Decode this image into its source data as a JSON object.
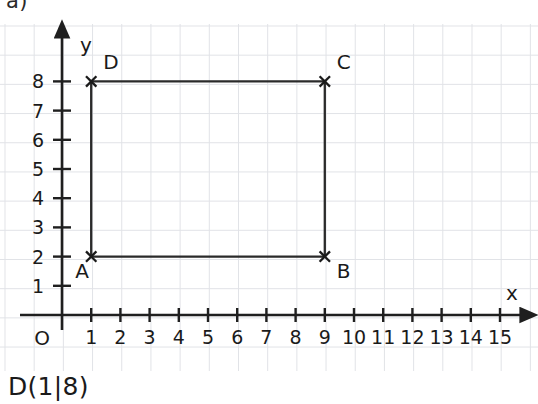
{
  "exercise": {
    "label": "a)"
  },
  "answer": {
    "text": "D(1|8)"
  },
  "chart_data": {
    "type": "scatter",
    "title": "",
    "xlabel": "x",
    "ylabel": "y",
    "origin_label": "O",
    "xlim": [
      0,
      15.8
    ],
    "ylim": [
      0,
      9.2
    ],
    "grid": true,
    "legend": "none",
    "x_ticks": [
      1,
      2,
      3,
      4,
      5,
      6,
      7,
      8,
      9,
      10,
      11,
      12,
      13,
      14,
      15
    ],
    "y_ticks": [
      1,
      2,
      3,
      4,
      5,
      6,
      7,
      8
    ],
    "x_tick_labels": [
      "1",
      "2",
      "3",
      "4",
      "5",
      "6",
      "7",
      "8",
      "9",
      "10",
      "11",
      "12",
      "13",
      "14",
      "15"
    ],
    "y_tick_labels": [
      "1",
      "2",
      "3",
      "4",
      "5",
      "6",
      "7",
      "8"
    ],
    "points": [
      {
        "name": "A",
        "x": 1,
        "y": 2,
        "label_dx": -16,
        "label_dy": 21
      },
      {
        "name": "B",
        "x": 9,
        "y": 2,
        "label_dx": 12,
        "label_dy": 21
      },
      {
        "name": "C",
        "x": 9,
        "y": 8,
        "label_dx": 12,
        "label_dy": -12
      },
      {
        "name": "D",
        "x": 1,
        "y": 8,
        "label_dx": 12,
        "label_dy": -12
      }
    ],
    "shape": {
      "kind": "rectangle",
      "vertices": [
        [
          1,
          2
        ],
        [
          9,
          2
        ],
        [
          9,
          8
        ],
        [
          1,
          8
        ]
      ],
      "closed": true
    },
    "colors": {
      "axis": "#1f1f1f",
      "shape": "#2a2a2a",
      "grid": "#c9ccd4",
      "text": "#1a1a1a",
      "background": "#ffffff"
    }
  }
}
